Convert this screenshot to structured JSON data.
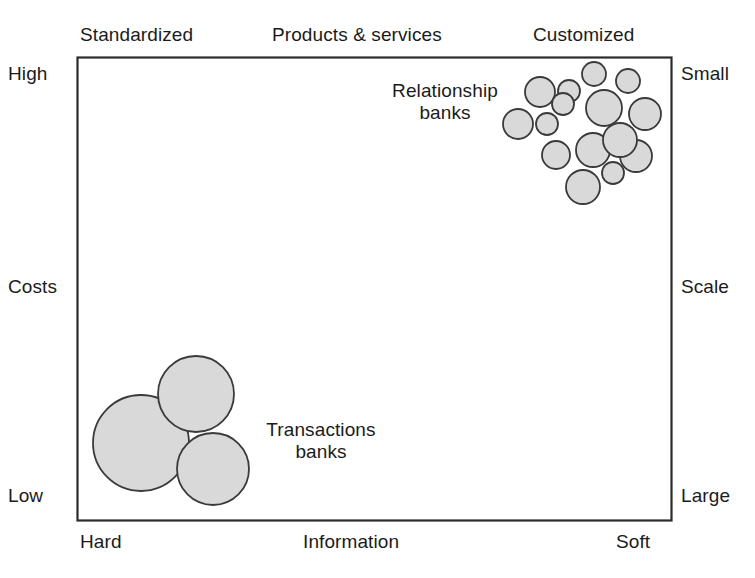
{
  "figure": {
    "axes": {
      "top": {
        "left_label": "Standardized",
        "center_label": "Products & services",
        "right_label": "Customized"
      },
      "left": {
        "top_label": "High",
        "center_label": "Costs",
        "bottom_label": "Low"
      },
      "right": {
        "top_label": "Small",
        "center_label": "Scale",
        "bottom_label": "Large"
      },
      "bottom": {
        "left_label": "Hard",
        "center_label": "Information",
        "right_label": "Soft"
      }
    },
    "annotations": {
      "relationship": {
        "line1": "Relationship",
        "line2": "banks"
      },
      "transactions": {
        "line1": "Transactions",
        "line2": "banks"
      }
    },
    "colors": {
      "bubble_fill": "#d9d9d9",
      "bubble_stroke": "#3a3a3a",
      "frame_stroke": "#2b2b2b",
      "text": "#1b1b1b",
      "background": "#ffffff"
    }
  },
  "chart_data": {
    "type": "scatter",
    "title": "",
    "subtitle": "",
    "xlabel": "Information",
    "ylabel": "Costs",
    "x_axis": {
      "name": "Information",
      "left_end": "Hard",
      "right_end": "Soft",
      "secondary_name": "Products & services",
      "secondary_left_end": "Standardized",
      "secondary_right_end": "Customized",
      "range": [
        0,
        100
      ],
      "ticks": []
    },
    "y_axis": {
      "name": "Costs",
      "top_end": "High",
      "bottom_end": "Low",
      "secondary_name": "Scale",
      "secondary_top_end": "Small",
      "secondary_bottom_end": "Large",
      "range": [
        0,
        100
      ],
      "ticks": []
    },
    "grid": false,
    "legend": "none",
    "plot_frame_px": {
      "left": 77,
      "top": 57,
      "right": 672,
      "bottom": 521
    },
    "series": [
      {
        "name": "Relationship banks",
        "label": "Relationship banks",
        "marker": "circle",
        "fill": "#d9d9d9",
        "stroke": "#3a3a3a",
        "note": "cluster of many small high-cost, customized, soft-information, small-scale banks",
        "count": 15,
        "points_px": [
          {
            "cx": 540,
            "cy": 92,
            "r": 15
          },
          {
            "cx": 569,
            "cy": 91,
            "r": 11
          },
          {
            "cx": 594,
            "cy": 74,
            "r": 12
          },
          {
            "cx": 628,
            "cy": 81,
            "r": 12
          },
          {
            "cx": 518,
            "cy": 124,
            "r": 15
          },
          {
            "cx": 547,
            "cy": 124,
            "r": 11
          },
          {
            "cx": 563,
            "cy": 104,
            "r": 11
          },
          {
            "cx": 604,
            "cy": 108,
            "r": 18
          },
          {
            "cx": 645,
            "cy": 114,
            "r": 16
          },
          {
            "cx": 556,
            "cy": 155,
            "r": 14
          },
          {
            "cx": 593,
            "cy": 150,
            "r": 17
          },
          {
            "cx": 636,
            "cy": 156,
            "r": 16
          },
          {
            "cx": 613,
            "cy": 173,
            "r": 11
          },
          {
            "cx": 583,
            "cy": 187,
            "r": 17
          },
          {
            "cx": 620,
            "cy": 140,
            "r": 17
          }
        ]
      },
      {
        "name": "Transactions banks",
        "label": "Transactions banks",
        "marker": "circle",
        "fill": "#d9d9d9",
        "stroke": "#3a3a3a",
        "note": "few very large low-cost, standardized, hard-information, large-scale banks",
        "count": 3,
        "points_px": [
          {
            "cx": 141,
            "cy": 443,
            "r": 48
          },
          {
            "cx": 196,
            "cy": 394,
            "r": 38
          },
          {
            "cx": 213,
            "cy": 469,
            "r": 36
          }
        ]
      }
    ]
  }
}
